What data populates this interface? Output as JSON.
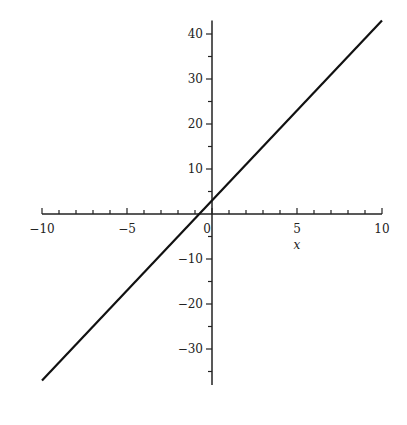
{
  "chart_data": {
    "type": "line",
    "title": "",
    "xlabel": "x",
    "ylabel": "",
    "xlim": [
      -10,
      10
    ],
    "ylim": [
      -38,
      43
    ],
    "grid": false,
    "legend": null,
    "x_ticks": [
      -10,
      -5,
      0,
      5,
      10
    ],
    "x_tick_labels": [
      "−10",
      "−5",
      "0",
      "5",
      "10"
    ],
    "y_ticks": [
      -30,
      -20,
      -10,
      10,
      20,
      30,
      40
    ],
    "y_tick_labels": [
      "−30",
      "−20",
      "−10",
      "10",
      "20",
      "30",
      "40"
    ],
    "series": [
      {
        "name": "4x + 3",
        "color": "#111111",
        "x": [
          -10,
          10
        ],
        "y": [
          -37,
          43
        ]
      }
    ]
  }
}
